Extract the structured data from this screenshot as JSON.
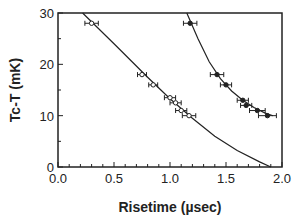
{
  "chart_data": {
    "type": "scatter",
    "title": "",
    "xlabel": "Risetime   (µsec)",
    "ylabel": "Tc-T  (mK)",
    "xlim": [
      0.0,
      2.0
    ],
    "ylim": [
      0,
      30
    ],
    "x_ticks": [
      "0.0",
      "0.5",
      "1.0",
      "1.5",
      "2.0"
    ],
    "y_ticks": [
      "0",
      "10",
      "20",
      "30"
    ],
    "grid": false,
    "legend": null,
    "series": [
      {
        "name": "open markers",
        "marker": "open",
        "points": [
          {
            "x": 0.3,
            "y": 28,
            "xerr": 0.06
          },
          {
            "x": 0.75,
            "y": 18,
            "xerr": 0.04
          },
          {
            "x": 0.85,
            "y": 16,
            "xerr": 0.04
          },
          {
            "x": 1.0,
            "y": 13.5,
            "xerr": 0.05
          },
          {
            "x": 1.05,
            "y": 12.5,
            "xerr": 0.05
          },
          {
            "x": 1.1,
            "y": 11,
            "xerr": 0.05
          },
          {
            "x": 1.17,
            "y": 10,
            "xerr": 0.06
          }
        ],
        "fit_curve": [
          [
            0.22,
            30
          ],
          [
            0.5,
            24
          ],
          [
            0.8,
            17.5
          ],
          [
            1.0,
            13.3
          ],
          [
            1.2,
            9.5
          ],
          [
            1.4,
            6.0
          ],
          [
            1.6,
            3.2
          ],
          [
            1.8,
            1.0
          ],
          [
            1.9,
            0
          ]
        ]
      },
      {
        "name": "filled markers",
        "marker": "filled",
        "points": [
          {
            "x": 1.18,
            "y": 28,
            "xerr": 0.06
          },
          {
            "x": 1.42,
            "y": 18,
            "xerr": 0.06
          },
          {
            "x": 1.5,
            "y": 16,
            "xerr": 0.05
          },
          {
            "x": 1.65,
            "y": 13,
            "xerr": 0.05
          },
          {
            "x": 1.68,
            "y": 12,
            "xerr": 0.05
          },
          {
            "x": 1.78,
            "y": 11,
            "xerr": 0.07
          },
          {
            "x": 1.87,
            "y": 10,
            "xerr": 0.08
          }
        ],
        "fit_curve": [
          [
            1.15,
            30
          ],
          [
            1.25,
            25
          ],
          [
            1.35,
            20.5
          ],
          [
            1.45,
            17.2
          ],
          [
            1.55,
            14.8
          ],
          [
            1.65,
            13
          ],
          [
            1.75,
            11.6
          ],
          [
            1.85,
            10.5
          ],
          [
            1.92,
            10
          ]
        ]
      }
    ]
  }
}
